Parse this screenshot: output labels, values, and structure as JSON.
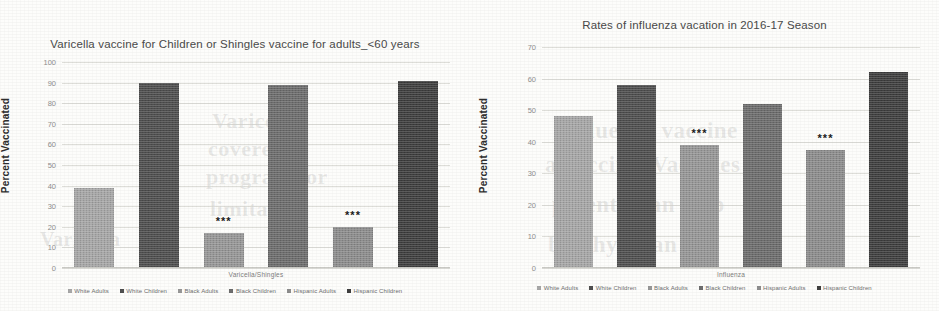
{
  "page": {
    "background_color": "#fdfdfb",
    "bleed_through_text": [
      "Varicella",
      "covered",
      "program for",
      "limitation",
      "influenza vaccine of",
      "a vaccine. Vaccines",
      "potential an Gap",
      "by physician"
    ]
  },
  "series_colors": {
    "white_adults": "#a8a8a8",
    "white_children": "#4f4f4f",
    "black_adults": "#989898",
    "black_children": "#6e6e6e",
    "hispanic_adults": "#8e8e8e",
    "hispanic_children": "#3f3f3f"
  },
  "legend": {
    "items": [
      {
        "label": "White Adults",
        "color": "#a8a8a8"
      },
      {
        "label": "White Children",
        "color": "#4f4f4f"
      },
      {
        "label": "Black Adults",
        "color": "#989898"
      },
      {
        "label": "Black Children",
        "color": "#6e6e6e"
      },
      {
        "label": "Hispanic Adults",
        "color": "#8e8e8e"
      },
      {
        "label": "Hispanic Children",
        "color": "#3f3f3f"
      }
    ]
  },
  "significance_marker": "***",
  "chart_data": [
    {
      "type": "bar",
      "id": "varicella-shingles",
      "title": "Varicella vaccine for Children or Shingles vaccine for adults_<60 years",
      "xlabel": "Varicella/Shingles",
      "ylabel": "Percent Vaccinated",
      "ylim": [
        0,
        100
      ],
      "yticks": [
        0,
        10,
        20,
        30,
        40,
        50,
        60,
        70,
        80,
        90,
        100
      ],
      "grid": true,
      "legend_position": "bottom",
      "categories": [
        "White Adults",
        "White Children",
        "Black Adults",
        "Black Children",
        "Hispanic Adults",
        "Hispanic Children"
      ],
      "values": [
        39,
        90,
        17,
        89,
        20,
        91
      ],
      "annotations": [
        {
          "category": "Black Adults",
          "text": "***"
        },
        {
          "category": "Hispanic Adults",
          "text": "***"
        }
      ]
    },
    {
      "type": "bar",
      "id": "influenza-2016-17",
      "title": "Rates of influenza vacation in 2016-17 Season",
      "xlabel": "Influenza",
      "ylabel": "Percent Vaccinated",
      "ylim": [
        0,
        70
      ],
      "yticks": [
        0,
        10,
        20,
        30,
        40,
        50,
        60,
        70
      ],
      "grid": true,
      "legend_position": "bottom",
      "categories": [
        "White Adults",
        "White Children",
        "Black Adults",
        "Black Children",
        "Hispanic Adults",
        "Hispanic Children"
      ],
      "values": [
        48,
        58,
        39,
        52,
        37.5,
        62
      ],
      "annotations": [
        {
          "category": "Black Adults",
          "text": "***"
        },
        {
          "category": "Hispanic Adults",
          "text": "***"
        }
      ]
    }
  ]
}
